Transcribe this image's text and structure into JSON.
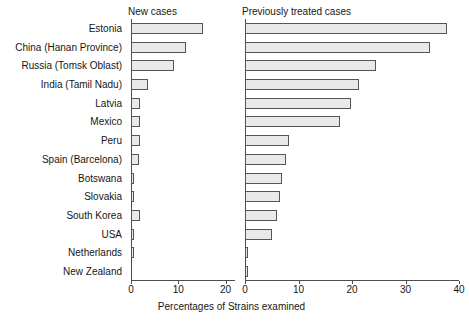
{
  "figure": {
    "xlabel": "Percentages of Strains examined",
    "panel_left_title": "New cases",
    "panel_right_title": "Previously treated cases"
  },
  "chart_data": {
    "type": "bar",
    "orientation": "horizontal",
    "title": "",
    "xlabel": "Percentages of Strains examined",
    "ylabel": "",
    "grid": false,
    "legend": null,
    "categories": [
      "Estonia",
      "China (Hanan Province)",
      "Russia (Tomsk Oblast)",
      "India (Tamil Nadu)",
      "Latvia",
      "Mexico",
      "Peru",
      "Spain (Barcelona)",
      "Botswana",
      "Slovakia",
      "South Korea",
      "USA",
      "Netherlands",
      "New Zealand"
    ],
    "panels": [
      {
        "name": "New cases",
        "xlim": [
          0,
          22
        ],
        "xticks": [
          0,
          10,
          20
        ],
        "xticklabels": [
          "0",
          "10",
          "20"
        ],
        "values": [
          15.3,
          11.6,
          9.0,
          3.5,
          1.9,
          1.9,
          1.9,
          1.7,
          0.6,
          0.6,
          1.8,
          0.6,
          0.6,
          0.0
        ]
      },
      {
        "name": "Previously treated cases",
        "xlim": [
          0,
          40
        ],
        "xticks": [
          0,
          10,
          20,
          30,
          40
        ],
        "xticklabels": [
          "0",
          "10",
          "20",
          "30",
          "40"
        ],
        "values": [
          37.7,
          34.5,
          24.5,
          21.3,
          19.8,
          17.7,
          8.3,
          7.7,
          7.0,
          6.6,
          5.9,
          5.1,
          0.5,
          0.4
        ]
      }
    ],
    "bar_fill_color": "#e9e9e9",
    "bar_edge_color": "#555555"
  }
}
